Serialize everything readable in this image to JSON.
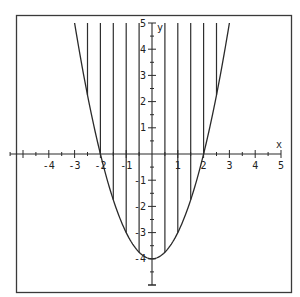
{
  "chart_data": {
    "type": "line",
    "title": "",
    "function": "y = x^2 - 4",
    "xlabel": "x",
    "ylabel": "y",
    "xlim": [
      -5,
      5
    ],
    "ylim": [
      -5,
      5
    ],
    "grid": false,
    "x_ticks": [
      -4,
      -3,
      -2,
      -1,
      1,
      2,
      3,
      4,
      5
    ],
    "y_ticks": [
      -4,
      -3,
      -2,
      -1,
      1,
      2,
      3,
      4,
      5
    ],
    "x_tick_labels": [
      "-4",
      "-3",
      "-2",
      "-1",
      "1",
      "2",
      "3",
      "4",
      "5"
    ],
    "y_tick_labels": [
      "-4",
      "-3",
      "-2",
      "-1",
      "1",
      "2",
      "3",
      "4",
      "5"
    ],
    "minor_tick_step": 0.5,
    "series": [
      {
        "name": "parabola",
        "x": [
          -3,
          -2.5,
          -2,
          -1.5,
          -1,
          -0.5,
          0,
          0.5,
          1,
          1.5,
          2,
          2.5,
          3
        ],
        "values": [
          5,
          2.25,
          0,
          -1.75,
          -3,
          -3.75,
          -4,
          -3.75,
          -3,
          -1.75,
          0,
          2.25,
          5
        ]
      }
    ],
    "shaded_region": {
      "style": "vertical hatch lines",
      "between": [
        "y = x^2 - 4",
        "y = 5"
      ],
      "x_range": [
        -3,
        3
      ],
      "hatch_x": [
        -2.5,
        -2,
        -1.5,
        -1,
        -0.5,
        0.5,
        1,
        1.5,
        2,
        2.5
      ]
    }
  },
  "labels": {
    "x_axis": "x",
    "y_axis": "y"
  }
}
